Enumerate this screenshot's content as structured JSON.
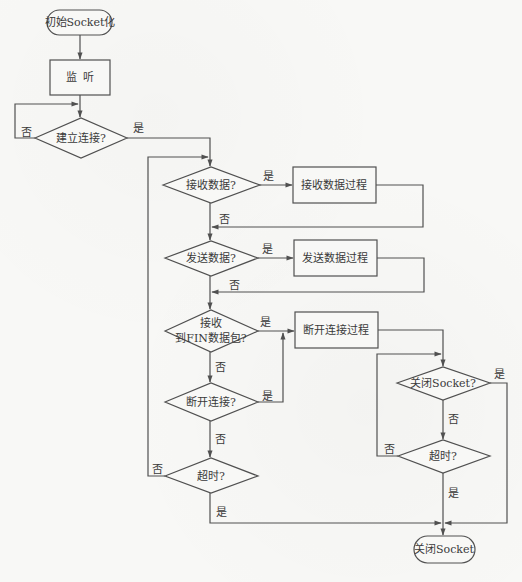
{
  "diagram": {
    "type": "flowchart",
    "style": {
      "line_color": "#505050",
      "text_color": "#3a3a3a",
      "background": "#f8f8f6"
    },
    "nodes": {
      "start": {
        "shape": "terminal",
        "label": "初始Socket化"
      },
      "listen": {
        "shape": "process",
        "label": "监  听"
      },
      "connect": {
        "shape": "decision",
        "label": "建立连接?"
      },
      "recv_q": {
        "shape": "decision",
        "label": "接收数据?"
      },
      "recv_proc": {
        "shape": "process",
        "label": "接收数据过程"
      },
      "send_q": {
        "shape": "decision",
        "label": "发送数据?"
      },
      "send_proc": {
        "shape": "process",
        "label": "发送数据过程"
      },
      "fin_q": {
        "shape": "decision",
        "label_line1": "接收",
        "label_line2": "到FIN数据包?"
      },
      "disc_q": {
        "shape": "decision",
        "label": "断开连接?"
      },
      "timeout_q": {
        "shape": "decision",
        "label": "超时?"
      },
      "disc_proc": {
        "shape": "process",
        "label": "断开连接过程"
      },
      "close_q": {
        "shape": "decision",
        "label": "关闭Socket?"
      },
      "timeout2_q": {
        "shape": "decision",
        "label": "超时?"
      },
      "end": {
        "shape": "terminal",
        "label": "关闭Socket"
      }
    },
    "edge_labels": {
      "yes": "是",
      "no": "否"
    },
    "edges": [
      {
        "from": "start",
        "to": "listen",
        "label": ""
      },
      {
        "from": "listen",
        "to": "connect",
        "label": ""
      },
      {
        "from": "connect",
        "to": "connect",
        "label": "否"
      },
      {
        "from": "connect",
        "to": "recv_q",
        "label": "是"
      },
      {
        "from": "recv_q",
        "to": "recv_proc",
        "label": "是"
      },
      {
        "from": "recv_q",
        "to": "send_q",
        "label": "否"
      },
      {
        "from": "recv_proc",
        "to": "send_q",
        "label": ""
      },
      {
        "from": "send_q",
        "to": "send_proc",
        "label": "是"
      },
      {
        "from": "send_q",
        "to": "fin_q",
        "label": "否"
      },
      {
        "from": "send_proc",
        "to": "fin_q",
        "label": ""
      },
      {
        "from": "fin_q",
        "to": "disc_proc",
        "label": "是"
      },
      {
        "from": "fin_q",
        "to": "disc_q",
        "label": "否"
      },
      {
        "from": "disc_q",
        "to": "disc_proc",
        "label": "是"
      },
      {
        "from": "disc_q",
        "to": "timeout_q",
        "label": "否"
      },
      {
        "from": "timeout_q",
        "to": "recv_q",
        "label": "否"
      },
      {
        "from": "timeout_q",
        "to": "end",
        "label": "是"
      },
      {
        "from": "disc_proc",
        "to": "close_q",
        "label": ""
      },
      {
        "from": "close_q",
        "to": "end",
        "label": "是"
      },
      {
        "from": "close_q",
        "to": "timeout2_q",
        "label": "否"
      },
      {
        "from": "timeout2_q",
        "to": "close_q",
        "label": "否"
      },
      {
        "from": "timeout2_q",
        "to": "end",
        "label": "是"
      }
    ]
  }
}
